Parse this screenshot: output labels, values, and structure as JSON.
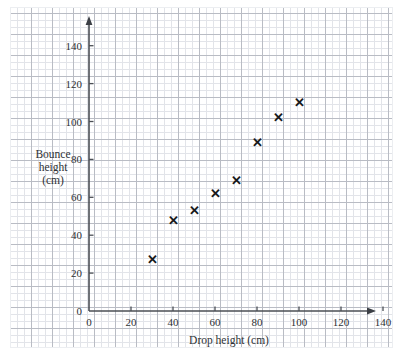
{
  "chart_data": {
    "type": "scatter",
    "title": "",
    "xlabel": "Drop height (cm)",
    "ylabel": "Bounce height (cm)",
    "ylabel_lines": [
      "Bounce",
      "height",
      "(cm)"
    ],
    "xlim": [
      0,
      150
    ],
    "ylim": [
      0,
      150
    ],
    "xticks": [
      0,
      20,
      40,
      60,
      80,
      100,
      120,
      140
    ],
    "yticks": [
      0,
      20,
      40,
      60,
      80,
      100,
      120,
      140
    ],
    "xtick_labels": [
      "0",
      "20",
      "40",
      "60",
      "80",
      "100",
      "120",
      "140"
    ],
    "ytick_labels": [
      "0",
      "20",
      "40",
      "60",
      "80",
      "100",
      "120",
      "140"
    ],
    "grid": true,
    "grid_style": "graph-paper",
    "legend": "none",
    "marker": "x",
    "x": [
      30,
      40,
      50,
      60,
      70,
      80,
      90,
      100
    ],
    "y": [
      27,
      48,
      53,
      62,
      69,
      89,
      102,
      110
    ],
    "points": [
      {
        "x": 30,
        "y": 27
      },
      {
        "x": 40,
        "y": 48
      },
      {
        "x": 50,
        "y": 53
      },
      {
        "x": 60,
        "y": 62
      },
      {
        "x": 70,
        "y": 69
      },
      {
        "x": 80,
        "y": 89
      },
      {
        "x": 90,
        "y": 102
      },
      {
        "x": 100,
        "y": 110
      }
    ],
    "marker_glyph": "✕",
    "colors": {
      "marker": "#17181a",
      "axis": "#4b4f55",
      "grid_major": "#b9bcc4",
      "grid_minor": "#e2e4e9",
      "background": "#ffffff",
      "text": "#2e3135"
    }
  }
}
